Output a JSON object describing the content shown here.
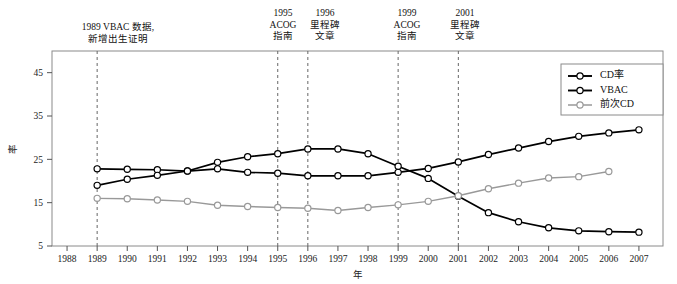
{
  "chart_data": {
    "type": "line",
    "title": "",
    "xlabel": "年",
    "ylabel": "率",
    "x": [
      1988,
      1989,
      1990,
      1991,
      1992,
      1993,
      1994,
      1995,
      1996,
      1997,
      1998,
      1999,
      2000,
      2001,
      2002,
      2003,
      2004,
      2005,
      2006,
      2007
    ],
    "xlim": [
      1987.5,
      2007.8
    ],
    "ylim": [
      5,
      50
    ],
    "yticks": [
      5,
      15,
      25,
      35,
      45
    ],
    "xticks": [
      1988,
      1989,
      1990,
      1991,
      1992,
      1993,
      1994,
      1995,
      1996,
      1997,
      1998,
      1999,
      2000,
      2001,
      2002,
      2003,
      2004,
      2005,
      2006,
      2007
    ],
    "grid": false,
    "legend_position": "top-right",
    "series": [
      {
        "name": "CD率",
        "color": "#000000",
        "x": [
          1989,
          1990,
          1991,
          1992,
          1993,
          1994,
          1995,
          1996,
          1997,
          1998,
          1999,
          2000,
          2001,
          2002,
          2003,
          2004,
          2005,
          2006,
          2007
        ],
        "values": [
          22.8,
          22.7,
          22.6,
          22.3,
          22.8,
          22.0,
          21.8,
          21.2,
          21.2,
          21.2,
          22.0,
          22.9,
          24.4,
          26.1,
          27.6,
          29.1,
          30.3,
          31.1,
          31.8
        ]
      },
      {
        "name": "VBAC",
        "color": "#000000",
        "x": [
          1989,
          1990,
          1991,
          1992,
          1993,
          1994,
          1995,
          1996,
          1997,
          1998,
          1999,
          2000,
          2001,
          2002,
          2003,
          2004,
          2005,
          2006,
          2007
        ],
        "values": [
          19.0,
          20.4,
          21.3,
          22.3,
          24.3,
          25.6,
          26.3,
          27.4,
          27.4,
          26.3,
          23.4,
          20.6,
          16.5,
          12.7,
          10.6,
          9.2,
          8.5,
          8.3,
          8.2
        ]
      },
      {
        "name": "前次CD",
        "color": "#999999",
        "x": [
          1989,
          1990,
          1991,
          1992,
          1993,
          1994,
          1995,
          1996,
          1997,
          1998,
          1999,
          2000,
          2001,
          2002,
          2003,
          2004,
          2005,
          2006
        ],
        "values": [
          16.0,
          15.9,
          15.6,
          15.3,
          14.4,
          14.1,
          13.9,
          13.7,
          13.2,
          13.9,
          14.5,
          15.3,
          16.6,
          18.2,
          19.5,
          20.7,
          21.0,
          22.2
        ]
      }
    ],
    "annotations": [
      {
        "id": "anno-1989",
        "year": 1989,
        "lines": [
          "1989 VBAC 数据,",
          "新增出生证明"
        ],
        "label_x": 118,
        "label_y": 30,
        "align": "center"
      },
      {
        "id": "anno-1995",
        "year": 1995,
        "lines": [
          "1995",
          "ACOG",
          "指南"
        ],
        "label_x": 283,
        "label_y": 16,
        "align": "center"
      },
      {
        "id": "anno-1996",
        "year": 1996,
        "lines": [
          "1996",
          "里程碑",
          "文章"
        ],
        "label_x": 325,
        "label_y": 16,
        "align": "center"
      },
      {
        "id": "anno-1999",
        "year": 1999,
        "lines": [
          "1999",
          "ACOG",
          "指南"
        ],
        "label_x": 407,
        "label_y": 16,
        "align": "center"
      },
      {
        "id": "anno-2001",
        "year": 2001,
        "lines": [
          "2001",
          "里程碑",
          "文章"
        ],
        "label_x": 465,
        "label_y": 16,
        "align": "center"
      }
    ],
    "legend": {
      "entries": [
        "CD率",
        "VBAC",
        "前次CD"
      ]
    }
  }
}
